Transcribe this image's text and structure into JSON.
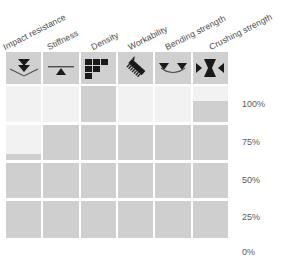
{
  "chart_data": {
    "type": "bar",
    "title": "",
    "subtitle": "",
    "xlabel": "",
    "ylabel": "",
    "orientation": "vertical",
    "grid": true,
    "legend": false,
    "ylim": [
      0,
      100
    ],
    "yunit": "%",
    "ytick_labels": [
      "100%",
      "75%",
      "50%",
      "25%",
      "0%"
    ],
    "ytick_values": [
      100,
      75,
      50,
      25,
      0
    ],
    "categories": [
      "Impact resistance",
      "Stiffness",
      "Density",
      "Workability",
      "Bending strength",
      "Crushing strength"
    ],
    "values": [
      55,
      75,
      100,
      75,
      75,
      90
    ],
    "series": [
      {
        "name": "Property rating",
        "values": [
          55,
          75,
          100,
          75,
          75,
          90
        ]
      }
    ],
    "bar_color": "#cfcfcf",
    "track_color": "#f2f2f2",
    "icon_cell_color": "#d0d0d0",
    "gridline_color": "#ffffff",
    "label_color": "#4a4a4a"
  },
  "columns": [
    {
      "label": "Impact resistance",
      "icon": "double-chevron-down-impact-icon",
      "value": 55,
      "value_label": "55%"
    },
    {
      "label": "Stiffness",
      "icon": "beam-on-fulcrum-icon",
      "value": 75,
      "value_label": "75%"
    },
    {
      "label": "Density",
      "icon": "stacked-bricks-icon",
      "value": 100,
      "value_label": "100%"
    },
    {
      "label": "Workability",
      "icon": "diagonal-saw-blade-icon",
      "value": 75,
      "value_label": "75%"
    },
    {
      "label": "Bending strength",
      "icon": "beam-sagging-between-supports-icon",
      "value": 75,
      "value_label": "75%"
    },
    {
      "label": "Crushing strength",
      "icon": "hourglass-compression-icon",
      "value": 90,
      "value_label": "90%"
    }
  ],
  "axis": {
    "ticks": [
      {
        "label": "100%",
        "value": 100
      },
      {
        "label": "75%",
        "value": 75
      },
      {
        "label": "50%",
        "value": 50
      },
      {
        "label": "25%",
        "value": 25
      },
      {
        "label": "0%",
        "value": 0
      }
    ]
  }
}
